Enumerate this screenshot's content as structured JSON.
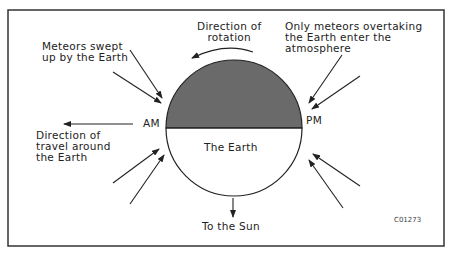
{
  "diagram": {
    "colors": {
      "frame": "#333333",
      "night_half": "#6a6a6a",
      "day_half": "#ffffff",
      "line": "#222222"
    },
    "labels": {
      "rotation": "Direction of\nrotation",
      "overtaking": "Only meteors overtaking\nthe Earth enter the\natmosphere",
      "swept": "Meteors swept\nup by the Earth",
      "am": "AM",
      "pm": "PM",
      "travel": "Direction of\ntravel around\nthe Earth",
      "earth": "The Earth",
      "sun": "To the Sun",
      "figure_id": "C01273"
    },
    "icons": {
      "arrows": "arrow-icon",
      "rotation_arrow": "curved-arrow-icon"
    }
  }
}
